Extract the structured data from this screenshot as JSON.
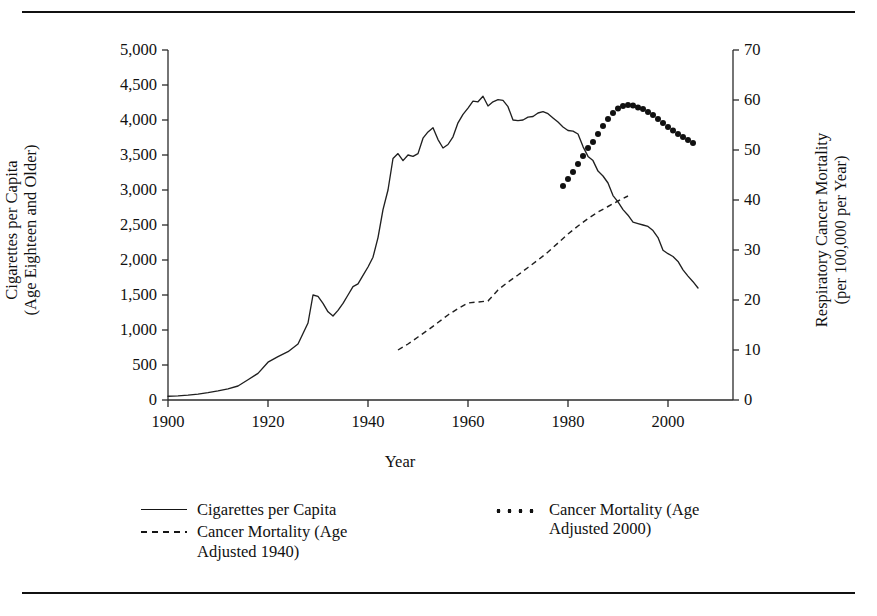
{
  "chart_data": {
    "type": "line",
    "title": "",
    "xlabel": "Year",
    "ylabel_left": "Cigarettes per Capita\n(Age Eighteen and Older)",
    "ylabel_left_line1": "Cigarettes per Capita",
    "ylabel_left_line2": "(Age Eighteen and Older)",
    "ylabel_right_line1": "Respiratory Cancer Mortality",
    "ylabel_right_line2": "(per 100,000 per Year)",
    "grid": false,
    "legend_position": "below-axes",
    "xlim": [
      1900,
      2013
    ],
    "xticks": [
      1900,
      1920,
      1940,
      1960,
      1980,
      2000
    ],
    "xticklabels": [
      "1900",
      "1920",
      "1940",
      "1960",
      "1980",
      "2000"
    ],
    "ylim_left": [
      0,
      5000
    ],
    "yticks_left": [
      0,
      500,
      1000,
      1500,
      2000,
      2500,
      3000,
      3500,
      4000,
      4500,
      5000
    ],
    "yticklabels_left": [
      "0",
      "500",
      "1,000",
      "1,500",
      "2,000",
      "2,500",
      "3,000",
      "3,500",
      "4,000",
      "4,500",
      "5,000"
    ],
    "ylim_right": [
      0,
      70
    ],
    "yticks_right": [
      0,
      10,
      20,
      30,
      40,
      50,
      60,
      70
    ],
    "yticklabels_right": [
      "0",
      "10",
      "20",
      "30",
      "40",
      "50",
      "60",
      "70"
    ],
    "series": [
      {
        "name": "Cigarettes per Capita",
        "style": "solid",
        "axis": "left",
        "x": [
          1900,
          1902,
          1904,
          1906,
          1908,
          1910,
          1912,
          1914,
          1916,
          1918,
          1920,
          1922,
          1924,
          1926,
          1928,
          1929,
          1930,
          1931,
          1932,
          1933,
          1934,
          1935,
          1936,
          1937,
          1938,
          1939,
          1940,
          1941,
          1942,
          1943,
          1944,
          1945,
          1946,
          1947,
          1948,
          1949,
          1950,
          1951,
          1952,
          1953,
          1954,
          1955,
          1956,
          1957,
          1958,
          1959,
          1960,
          1961,
          1962,
          1963,
          1964,
          1965,
          1966,
          1967,
          1968,
          1969,
          1970,
          1971,
          1972,
          1973,
          1974,
          1975,
          1976,
          1977,
          1978,
          1979,
          1980,
          1981,
          1982,
          1983,
          1984,
          1985,
          1986,
          1987,
          1988,
          1989,
          1990,
          1991,
          1992,
          1993,
          1994,
          1995,
          1996,
          1997,
          1998,
          1999,
          2000,
          2001,
          2002,
          2003,
          2004,
          2005,
          2006
        ],
        "y": [
          54,
          60,
          70,
          85,
          105,
          130,
          160,
          200,
          290,
          380,
          540,
          620,
          690,
          800,
          1100,
          1500,
          1480,
          1380,
          1260,
          1200,
          1280,
          1380,
          1500,
          1620,
          1660,
          1780,
          1900,
          2040,
          2320,
          2720,
          3000,
          3450,
          3520,
          3420,
          3500,
          3480,
          3520,
          3740,
          3830,
          3890,
          3720,
          3600,
          3650,
          3760,
          3960,
          4080,
          4170,
          4270,
          4260,
          4340,
          4200,
          4260,
          4290,
          4280,
          4190,
          4000,
          3990,
          4000,
          4040,
          4050,
          4100,
          4120,
          4090,
          4030,
          3970,
          3900,
          3850,
          3840,
          3800,
          3620,
          3480,
          3420,
          3270,
          3200,
          3100,
          2920,
          2830,
          2720,
          2640,
          2540,
          2520,
          2500,
          2480,
          2420,
          2320,
          2140,
          2090,
          2050,
          1980,
          1860,
          1770,
          1690,
          1600
        ]
      },
      {
        "name": "Cancer Mortality (Age Adjusted 1940)",
        "style": "dashed",
        "axis": "right",
        "x": [
          1946,
          1948,
          1950,
          1952,
          1954,
          1956,
          1958,
          1960,
          1962,
          1964,
          1966,
          1968,
          1970,
          1972,
          1974,
          1976,
          1978,
          1980,
          1982,
          1984,
          1986,
          1988,
          1990,
          1992
        ],
        "y": [
          10.0,
          11.2,
          12.6,
          14.0,
          15.5,
          17.0,
          18.3,
          19.4,
          19.6,
          19.8,
          22.0,
          23.6,
          25.0,
          26.5,
          28.0,
          29.6,
          31.4,
          33.2,
          34.8,
          36.3,
          37.6,
          38.7,
          39.8,
          40.8
        ]
      },
      {
        "name": "Cancer Mortality (Age Adjusted 2000)",
        "style": "dotted",
        "axis": "right",
        "x": [
          1979,
          1980,
          1981,
          1982,
          1983,
          1984,
          1985,
          1986,
          1987,
          1988,
          1989,
          1990,
          1991,
          1992,
          1993,
          1994,
          1995,
          1996,
          1997,
          1998,
          1999,
          2000,
          2001,
          2002,
          2003,
          2004,
          2005
        ],
        "y": [
          42.8,
          44.2,
          45.6,
          47.2,
          48.8,
          50.4,
          51.6,
          53.2,
          54.8,
          56.2,
          57.4,
          58.3,
          58.8,
          59.0,
          58.9,
          58.5,
          58.2,
          57.6,
          57.0,
          56.2,
          55.4,
          54.6,
          53.9,
          53.2,
          52.6,
          52.0,
          51.4
        ]
      }
    ]
  },
  "legend": {
    "items": [
      {
        "key": "solid",
        "label": "Cigarettes per Capita"
      },
      {
        "key": "dashed",
        "label": "Cancer Mortality (Age Adjusted 1940)"
      },
      {
        "key": "dotted",
        "label": "Cancer Mortality (Age Adjusted 2000)"
      }
    ],
    "item_solid_label": "Cigarettes per Capita",
    "item_dashed_line1": "Cancer Mortality (Age",
    "item_dashed_line2": "Adjusted 1940)",
    "item_dotted_line1": "Cancer Mortality (Age",
    "item_dotted_line2": "Adjusted 2000)"
  },
  "colors": {
    "ink": "#1a1a1a",
    "axis": "#2a2a2a",
    "background": "#ffffff"
  }
}
